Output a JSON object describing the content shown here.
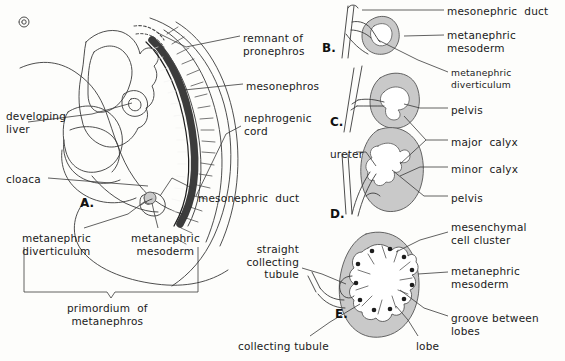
{
  "figure": {
    "panels": [
      {
        "id": "A",
        "letter": "A.",
        "x": 80,
        "y": 196
      },
      {
        "id": "B",
        "letter": "B.",
        "x": 322,
        "y": 41
      },
      {
        "id": "C",
        "letter": "C.",
        "x": 330,
        "y": 115
      },
      {
        "id": "D",
        "letter": "D.",
        "x": 330,
        "y": 207
      },
      {
        "id": "E",
        "letter": "E.",
        "x": 335,
        "y": 307
      }
    ],
    "labels": [
      {
        "key": "remnant_of_pronephros",
        "text": "remnant of\npronephros",
        "x": 243,
        "y": 32,
        "align": "left",
        "size": "normal"
      },
      {
        "key": "mesonephros",
        "text": "mesonephros",
        "x": 246,
        "y": 80,
        "align": "left",
        "size": "normal"
      },
      {
        "key": "nephrogenic_cord",
        "text": "nephrogenic\ncord",
        "x": 244,
        "y": 112,
        "align": "left",
        "size": "normal"
      },
      {
        "key": "developing_liver",
        "text": "developing\nliver",
        "x": 6,
        "y": 110,
        "align": "left",
        "size": "normal"
      },
      {
        "key": "cloaca",
        "text": "cloaca",
        "x": 6,
        "y": 173,
        "align": "left",
        "size": "normal"
      },
      {
        "key": "mesonephric_duct_a",
        "text": "mesonephric  duct",
        "x": 198,
        "y": 192,
        "align": "left",
        "size": "normal"
      },
      {
        "key": "metanephric_diverticulum_a",
        "text": "metanephric\ndiverticulum",
        "x": 22,
        "y": 232,
        "align": "left",
        "size": "normal"
      },
      {
        "key": "metanephric_mesoderm_a",
        "text": "metanephric\nmesoderm",
        "x": 131,
        "y": 232,
        "align": "left",
        "size": "normal"
      },
      {
        "key": "primordium_of_metanephros",
        "text": "primordium  of\nmetanephros",
        "x": 67,
        "y": 302,
        "align": "left",
        "size": "normal"
      },
      {
        "key": "mesonephric_duct_b",
        "text": "mesonephric  duct",
        "x": 447,
        "y": 5,
        "align": "left",
        "size": "normal"
      },
      {
        "key": "metanephric_mesoderm_b",
        "text": "metanephric\nmesoderm",
        "x": 447,
        "y": 29,
        "align": "left",
        "size": "normal"
      },
      {
        "key": "metanephric_diverticulum_c",
        "text": "metanephric\ndiverticulum",
        "x": 451,
        "y": 67,
        "align": "left",
        "size": "small"
      },
      {
        "key": "pelvis_c",
        "text": "pelvis",
        "x": 451,
        "y": 104,
        "align": "left",
        "size": "normal"
      },
      {
        "key": "major_calyx",
        "text": "major  calyx",
        "x": 451,
        "y": 136,
        "align": "left",
        "size": "normal"
      },
      {
        "key": "minor_calyx",
        "text": "minor  calyx",
        "x": 451,
        "y": 163,
        "align": "left",
        "size": "normal"
      },
      {
        "key": "ureter",
        "text": "ureter",
        "x": 330,
        "y": 148,
        "align": "left",
        "size": "normal"
      },
      {
        "key": "pelvis_d",
        "text": "pelvis",
        "x": 451,
        "y": 192,
        "align": "left",
        "size": "normal"
      },
      {
        "key": "mesenchymal_cell_cluster",
        "text": "mesenchymal\ncell cluster",
        "x": 451,
        "y": 221,
        "align": "left",
        "size": "normal"
      },
      {
        "key": "straight_collecting_tubule",
        "text": "straight\ncollecting\ntubule",
        "x": 299,
        "y": 243,
        "align": "right",
        "size": "normal"
      },
      {
        "key": "metanephric_mesoderm_e",
        "text": "metanephric\nmesoderm",
        "x": 451,
        "y": 265,
        "align": "left",
        "size": "normal"
      },
      {
        "key": "groove_between_lobes",
        "text": "groove between\nlobes",
        "x": 451,
        "y": 312,
        "align": "left",
        "size": "normal"
      },
      {
        "key": "collecting_tubule",
        "text": "collecting tubule",
        "x": 238,
        "y": 340,
        "align": "left",
        "size": "normal"
      },
      {
        "key": "lobe",
        "text": "lobe",
        "x": 416,
        "y": 340,
        "align": "left",
        "size": "normal"
      }
    ],
    "colors": {
      "ink": "#1a1a1a",
      "line": "#3a3a3a",
      "mesoderm_fill": "#c9c9c9",
      "mesoderm_stroke": "#555555",
      "dark_ridge": "#2b2b2b",
      "background": "#fdfdfb",
      "white": "#ffffff"
    }
  }
}
